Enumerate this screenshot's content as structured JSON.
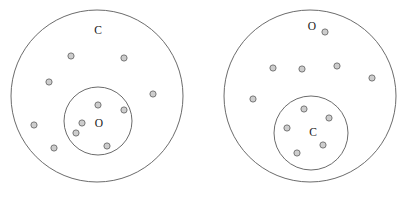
{
  "figure": {
    "canvas": {
      "width": 413,
      "height": 197,
      "background": "#ffffff"
    },
    "style": {
      "circle_stroke": "#5a5a5a",
      "circle_fill": "#ffffff",
      "dot_fill": "#cdcdcd",
      "dot_stroke": "#6b6b6b",
      "dot_radius": 3.1,
      "label_color": "#1a1a1a"
    },
    "diagrams": [
      {
        "id": "left-diagram",
        "name": "left-diagram",
        "outer": {
          "label": "C",
          "label_x": 98,
          "label_y": 31,
          "cx": 97,
          "cy": 96,
          "r": 86
        },
        "inner": {
          "label": "O",
          "label_x": 99,
          "label_y": 124,
          "cx": 98,
          "cy": 121,
          "r": 34
        },
        "dots_outer_ring": [
          {
            "x": 71,
            "y": 56
          },
          {
            "x": 124,
            "y": 58
          },
          {
            "x": 49,
            "y": 82
          },
          {
            "x": 153,
            "y": 94
          },
          {
            "x": 34,
            "y": 125
          },
          {
            "x": 54,
            "y": 148
          }
        ],
        "dots_inner": [
          {
            "x": 98,
            "y": 105
          },
          {
            "x": 124,
            "y": 110
          },
          {
            "x": 82,
            "y": 123
          },
          {
            "x": 76,
            "y": 133
          },
          {
            "x": 107,
            "y": 146
          }
        ]
      },
      {
        "id": "right-diagram",
        "name": "right-diagram",
        "outer": {
          "label": "O",
          "label_x": 312,
          "label_y": 27,
          "cx": 310,
          "cy": 96,
          "r": 86
        },
        "inner": {
          "label": "C",
          "label_x": 313,
          "label_y": 133,
          "cx": 311,
          "cy": 133,
          "r": 37
        },
        "dots_outer_ring": [
          {
            "x": 325,
            "y": 32
          },
          {
            "x": 273,
            "y": 68
          },
          {
            "x": 302,
            "y": 69
          },
          {
            "x": 337,
            "y": 66
          },
          {
            "x": 372,
            "y": 78
          },
          {
            "x": 253,
            "y": 99
          }
        ],
        "dots_inner": [
          {
            "x": 304,
            "y": 109
          },
          {
            "x": 329,
            "y": 118
          },
          {
            "x": 287,
            "y": 128
          },
          {
            "x": 323,
            "y": 145
          },
          {
            "x": 297,
            "y": 153
          }
        ]
      }
    ]
  },
  "chart_data": {
    "type": "scatter",
    "xlabel": "",
    "ylabel": "",
    "xlim": [
      0,
      413
    ],
    "ylim": [
      0,
      197
    ],
    "grid": false,
    "legend": null,
    "annotations": [
      "C",
      "O",
      "O",
      "C"
    ],
    "series": [
      {
        "name": "left-diagram-outer-ring-dots",
        "x": [
          71,
          124,
          49,
          153,
          34,
          54
        ],
        "y": [
          56,
          58,
          82,
          94,
          125,
          148
        ],
        "count": 6
      },
      {
        "name": "left-diagram-inner-dots",
        "x": [
          98,
          124,
          82,
          76,
          107
        ],
        "y": [
          105,
          110,
          123,
          133,
          146
        ],
        "count": 5
      },
      {
        "name": "right-diagram-outer-ring-dots",
        "x": [
          325,
          273,
          302,
          337,
          372,
          253
        ],
        "y": [
          32,
          68,
          69,
          66,
          78,
          99
        ],
        "count": 6
      },
      {
        "name": "right-diagram-inner-dots",
        "x": [
          304,
          329,
          287,
          323,
          297
        ],
        "y": [
          109,
          118,
          128,
          145,
          153
        ],
        "count": 5
      }
    ]
  }
}
